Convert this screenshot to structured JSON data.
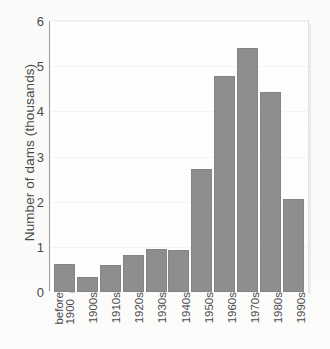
{
  "chart_data": {
    "type": "bar",
    "title": "",
    "xlabel": "",
    "ylabel": "Number of dams (thousands)",
    "categories": [
      "before 1900",
      "1900s",
      "1910s",
      "1920s",
      "1930s",
      "1940s",
      "1950s",
      "1960s",
      "1970s",
      "1980s",
      "1990s"
    ],
    "category_lines": [
      [
        "before",
        "1900"
      ],
      [
        "1900s"
      ],
      [
        "1910s"
      ],
      [
        "1920s"
      ],
      [
        "1930s"
      ],
      [
        "1940s"
      ],
      [
        "1950s"
      ],
      [
        "1960s"
      ],
      [
        "1970s"
      ],
      [
        "1980s"
      ],
      [
        "1990s"
      ]
    ],
    "values": [
      0.63,
      0.34,
      0.6,
      0.81,
      0.96,
      0.92,
      2.73,
      4.78,
      5.4,
      4.43,
      2.07
    ],
    "ylim": [
      0,
      6
    ],
    "yticks": [
      0,
      1,
      2,
      3,
      4,
      5,
      6
    ],
    "ytick_labels": [
      "0",
      "1",
      "2",
      "3",
      "4",
      "5",
      "6"
    ],
    "grid": "horizontal-faint",
    "legend": "none",
    "bar_color": "#8e8e8e",
    "bar_edge_color": "#848484",
    "axis_color": "#9a9a9a",
    "text_color": "#4a4a4a",
    "plot_background": "#fefefe",
    "figure_background": "#fbfbfa"
  }
}
